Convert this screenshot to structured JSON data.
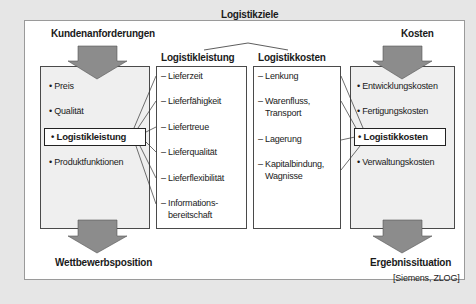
{
  "diagram": {
    "top_title": "Logistikziele",
    "left": {
      "title": "Kundenanforderungen",
      "items": [
        "• Preis",
        "• Qualität",
        "• Logistikleistung",
        "• Produktfunktionen"
      ],
      "highlighted_index": 2,
      "result": "Wettbewerbsposition"
    },
    "logistikleistung": {
      "title": "Logistikleistung",
      "items": [
        "– Lieferzeit",
        "– Lieferfähigkeit",
        "– Liefertreue",
        "– Lieferqualität",
        "– Lieferflexibilität",
        "– Informations-",
        "bereitschaft"
      ]
    },
    "logistikkosten": {
      "title": "Logistikkosten",
      "items": [
        "– Lenkung",
        "– Warenfluss,",
        "Transport",
        "– Lagerung",
        "– Kapitalbindung,",
        "Wagnisse"
      ]
    },
    "right": {
      "title": "Kosten",
      "items": [
        "• Entwicklungskosten",
        "• Fertigungskosten",
        "• Logistikkosten",
        "• Verwaltungskosten"
      ],
      "highlighted_index": 2,
      "result": "Ergebnissituation"
    },
    "source": "[Siemens, ZLOG]",
    "colors": {
      "arrow_fill": "#8c8c8c",
      "box_gray": "#efefef",
      "background": "#e6e6e6"
    }
  }
}
